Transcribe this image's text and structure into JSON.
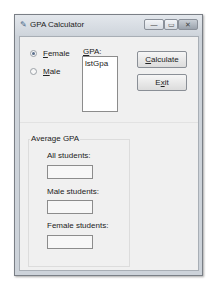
{
  "window": {
    "title": "GPA Calculator",
    "controls": {
      "minimize": "—",
      "maximize": "▭",
      "close": "✕"
    }
  },
  "gender": {
    "options": [
      {
        "label": "Female",
        "mnemonic": "F",
        "rest": "emale",
        "checked": true
      },
      {
        "label": "Male",
        "mnemonic": "M",
        "rest": "ale",
        "checked": false
      }
    ]
  },
  "gpa": {
    "label_mnemonic": "G",
    "label_rest": "PA:",
    "listbox_items": [
      "lstGpa"
    ]
  },
  "buttons": {
    "calculate": {
      "mnemonic": "C",
      "rest": "alculate"
    },
    "exit": {
      "pre": "E",
      "mnemonic": "x",
      "rest": "it"
    }
  },
  "average_group": {
    "title": "Average GPA",
    "fields": [
      {
        "label": "All students:",
        "value": ""
      },
      {
        "label": "Male students:",
        "value": ""
      },
      {
        "label": "Female students:",
        "value": ""
      }
    ]
  }
}
